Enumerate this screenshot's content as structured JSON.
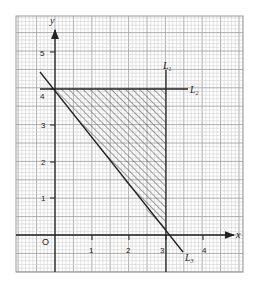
{
  "chart_data": {
    "type": "line",
    "title": "",
    "xlabel": "x",
    "ylabel": "y",
    "origin_label": "O",
    "xlim": [
      -1,
      4.8
    ],
    "ylim": [
      -1,
      5.8
    ],
    "x_ticks": [
      1,
      2,
      3,
      4
    ],
    "x_tick_labels": [
      "1",
      "2",
      "3",
      "4"
    ],
    "y_ticks": [
      1,
      2,
      3,
      4,
      5
    ],
    "y_tick_labels": [
      "1",
      "2",
      "3",
      "4",
      "5"
    ],
    "grid": true,
    "grid_minor_step": 0.1,
    "series": [
      {
        "name": "L1",
        "label": "L",
        "subscript": "1",
        "kind": "vertical",
        "equation": "x = 3",
        "x": [
          3,
          3
        ],
        "y": [
          -1,
          4.6
        ]
      },
      {
        "name": "L2",
        "label": "L",
        "subscript": "2",
        "kind": "horizontal",
        "equation": "y = 4",
        "x": [
          -0.4,
          3.6
        ],
        "y": [
          4,
          4
        ]
      },
      {
        "name": "L3",
        "label": "L",
        "subscript": "3",
        "kind": "slanted",
        "equation": "4x + 3y = 12",
        "x": [
          -0.4,
          3.4
        ],
        "y": [
          4.5,
          -0.45
        ]
      }
    ],
    "shaded_region": {
      "description": "hatched triangle bounded by L1, L2 and L3",
      "vertices": [
        [
          0,
          4
        ],
        [
          3,
          4
        ],
        [
          3,
          0
        ]
      ]
    }
  },
  "labels": {
    "x_axis": "x",
    "y_axis": "y",
    "origin": "O",
    "L1_main": "L",
    "L1_sub": "1",
    "L2_main": "L",
    "L2_sub": "2",
    "L3_main": "L",
    "L3_sub": "3",
    "xt1": "1",
    "xt2": "2",
    "xt3": "3",
    "xt4": "4",
    "yt1": "1",
    "yt2": "2",
    "yt3": "3",
    "yt4": "4",
    "yt5": "5"
  },
  "colors": {
    "grid_minor": "#c8c8c8",
    "grid_major": "#9a9a9a",
    "axis": "#222222",
    "hatch": "#444444"
  }
}
